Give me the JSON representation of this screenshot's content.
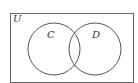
{
  "diagram": {
    "type": "venn",
    "universe_label": "U",
    "sets": [
      {
        "label": "C"
      },
      {
        "label": "D"
      }
    ],
    "stroke_color": "#555555"
  }
}
